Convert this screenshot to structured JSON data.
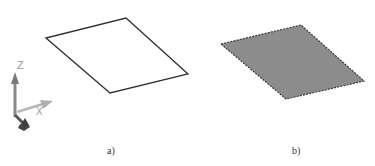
{
  "figure": {
    "panels": [
      {
        "id": "a",
        "caption": "a)",
        "shape": "parallelogram",
        "style": "outline-only"
      },
      {
        "id": "b",
        "caption": "b)",
        "shape": "parallelogram",
        "style": "filled-surface"
      }
    ],
    "axis_icon": {
      "z_label": "Z",
      "x_label": "X"
    },
    "colors": {
      "outline": "#333333",
      "fill": "#8c8c8c",
      "dashed_edge": "#3a3a3a",
      "axis_light": "#9a9a9a",
      "axis_dark": "#444444"
    }
  }
}
